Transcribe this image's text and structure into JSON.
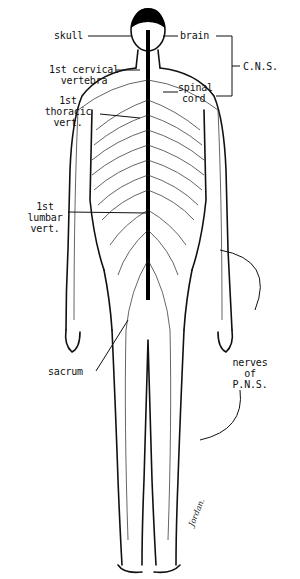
{
  "diagram": {
    "labels": {
      "skull": "skull",
      "cervical_1": "1st cervical",
      "cervical_2": "vertebra",
      "thoracic_1": "1st",
      "thoracic_2": "thoracic",
      "thoracic_3": "vert.",
      "lumbar_1": "1st",
      "lumbar_2": "lumbar",
      "lumbar_3": "vert.",
      "sacrum": "sacrum",
      "brain": "brain",
      "spinal_1": "spinal",
      "spinal_2": "cord",
      "cns": "C.N.S.",
      "pns_1": "nerves",
      "pns_2": "of",
      "pns_3": "P.N.S."
    },
    "signature": "Jordan."
  }
}
